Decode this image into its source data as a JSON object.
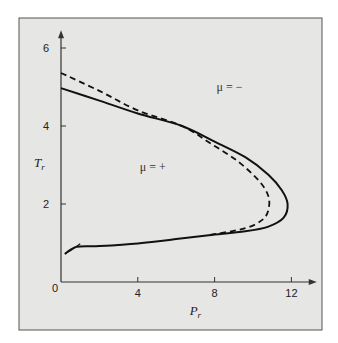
{
  "chart_data": {
    "type": "line",
    "title": "",
    "xlabel": "P",
    "xlabel_sub": "r",
    "ylabel": "T",
    "ylabel_sub": "r",
    "xlim": [
      0,
      12.8
    ],
    "ylim": [
      0,
      6.2
    ],
    "xticks": [
      0,
      4,
      8,
      12
    ],
    "yticks": [
      2,
      4,
      6
    ],
    "origin_label": "0",
    "grid": false,
    "legend": null,
    "annotations": [
      {
        "text": "μ = +",
        "x": 4.1,
        "y": 2.85
      },
      {
        "text": "μ = −",
        "x": 8.1,
        "y": 4.9
      }
    ],
    "series": [
      {
        "name": "solid curve",
        "style": "solid",
        "points": [
          [
            0.0,
            4.97
          ],
          [
            2.0,
            4.65
          ],
          [
            4.0,
            4.32
          ],
          [
            6.3,
            4.0
          ],
          [
            8.0,
            3.6
          ],
          [
            9.6,
            3.2
          ],
          [
            10.8,
            2.75
          ],
          [
            11.5,
            2.35
          ],
          [
            11.8,
            2.0
          ],
          [
            11.6,
            1.65
          ],
          [
            10.8,
            1.42
          ],
          [
            9.6,
            1.3
          ],
          [
            7.7,
            1.2
          ],
          [
            6.0,
            1.1
          ],
          [
            4.0,
            0.99
          ],
          [
            2.0,
            0.92
          ],
          [
            0.8,
            0.9
          ],
          [
            0.2,
            0.72
          ]
        ]
      },
      {
        "name": "dashed curve",
        "style": "dashed",
        "points": [
          [
            0.0,
            5.36
          ],
          [
            2.0,
            4.9
          ],
          [
            4.0,
            4.4
          ],
          [
            6.3,
            4.0
          ],
          [
            7.8,
            3.55
          ],
          [
            9.2,
            3.1
          ],
          [
            10.3,
            2.6
          ],
          [
            10.8,
            2.2
          ],
          [
            10.8,
            1.85
          ],
          [
            10.5,
            1.6
          ],
          [
            9.6,
            1.38
          ],
          [
            7.7,
            1.2
          ]
        ]
      },
      {
        "name": "lower hook",
        "style": "solid",
        "points": [
          [
            0.2,
            0.72
          ],
          [
            0.6,
            0.84
          ],
          [
            1.0,
            0.98
          ]
        ]
      }
    ]
  }
}
